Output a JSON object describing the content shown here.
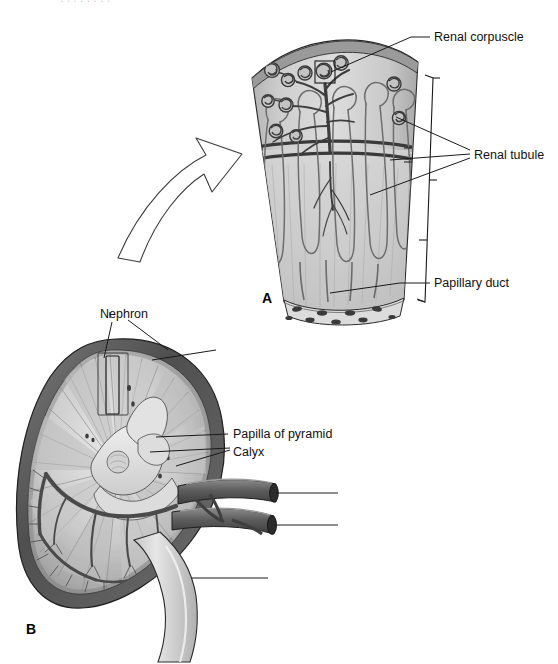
{
  "figure": {
    "background_color": "#ffffff",
    "ink_color": "#111111",
    "panels": [
      {
        "letter": "A",
        "name": "cortical-medullary-wedge",
        "description": "Magnified wedge of kidney showing nephrons from cortex to papilla"
      },
      {
        "letter": "B",
        "name": "kidney-coronal-section",
        "description": "Coronal section of whole kidney with vasculature and ureter"
      }
    ],
    "labels": {
      "renal_corpuscle": "Renal corpuscle",
      "renal_tubule": "Renal tubule",
      "papillary_duct": "Papillary duct",
      "nephron": "Nephron",
      "papilla_of_pyramid": "Papilla of pyramid",
      "calyx": "Calyx"
    },
    "unlabeled_leaders": [
      {
        "name": "leader-renal-artery",
        "text": ""
      },
      {
        "name": "leader-renal-vein",
        "text": ""
      },
      {
        "name": "leader-ureter",
        "text": ""
      }
    ],
    "colors": {
      "tissue_light": "#d9d9d9",
      "tissue_mid": "#b9b9b9",
      "tissue_dark": "#8f8f8f",
      "capsule_dark": "#5a5a5a",
      "vessel_dark": "#4a4a4a",
      "outline": "#1a1a1a"
    }
  }
}
